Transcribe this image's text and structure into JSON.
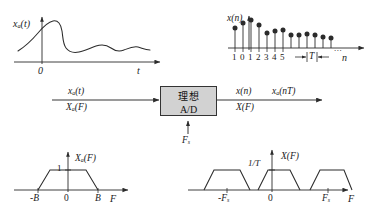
{
  "figure": {
    "stroke_color": "#2b2b2b",
    "block_fill": "#d2d2d2",
    "background": "#ffffff"
  },
  "panel_analog_signal": {
    "name": "continuous-time-signal-plot",
    "signal_label": "x",
    "signal_label_sub": "a",
    "signal_label_arg": "(t)",
    "x_axis_label": "t",
    "origin_label": "0",
    "curve_points": "rise-peak-drop-decaying-ripple"
  },
  "panel_discrete_signal": {
    "name": "discrete-time-sequence-plot",
    "signal_label": "x(n)",
    "x_axis_label": "n",
    "period_label": "T",
    "ellipsis": "...",
    "tick_labels": [
      "1",
      "0",
      "1",
      "2",
      "3",
      "4",
      "5"
    ],
    "stem_values": [
      0.62,
      0.8,
      0.88,
      0.74,
      0.45,
      0.5,
      0.53,
      0.4,
      0.4,
      0.42,
      0.4,
      0.36,
      0.33
    ]
  },
  "block": {
    "name": "ideal-ad-converter-block",
    "line1": "理想",
    "line2": "A/D",
    "clock_label": "F",
    "clock_label_sub": "s"
  },
  "input_signal": {
    "top_label": "x",
    "top_label_sub": "a",
    "top_label_arg": "(t)",
    "bottom_label": "X",
    "bottom_label_sub": "a",
    "bottom_label_arg": "(F)"
  },
  "output_signal": {
    "top_label_1": "x(n)",
    "top_label_2": "x",
    "top_label_2_sub": "a",
    "top_label_2_arg": "(nT)",
    "bottom_label": "X(F)"
  },
  "panel_analog_spectrum": {
    "name": "analog-spectrum-plot",
    "spectrum_label": "X",
    "spectrum_label_sub": "a",
    "spectrum_label_arg": "(F)",
    "amplitude_label": "1",
    "x_axis_label": "F",
    "tick_labels": [
      "-B",
      "0",
      "B"
    ],
    "shape": "trapezoid",
    "band_limit": "B"
  },
  "panel_sampled_spectrum": {
    "name": "sampled-spectrum-plot",
    "spectrum_label": "X(F)",
    "amplitude_label": "1/T",
    "x_axis_label": "F",
    "tick_labels": [
      "-F",
      "0",
      "F"
    ],
    "tick_sub": "s",
    "shape": "periodic-trapezoid-replicas",
    "replica_count": 3
  }
}
